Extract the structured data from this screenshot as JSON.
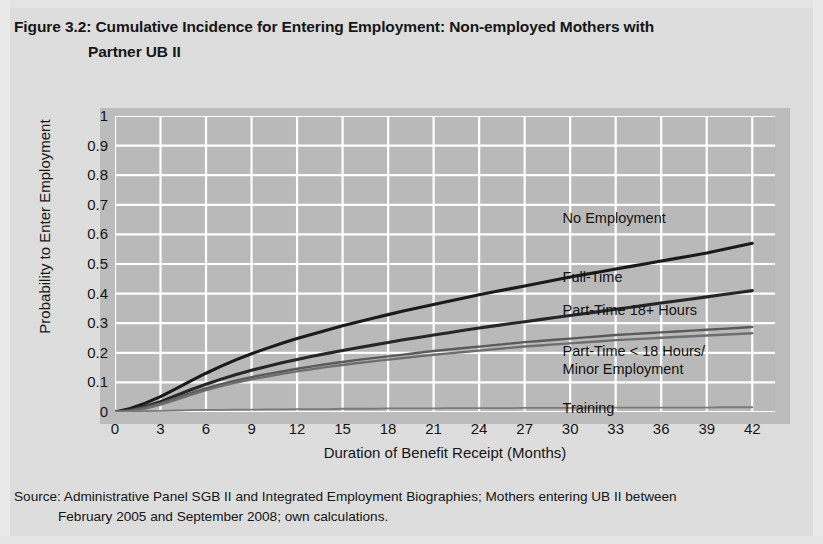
{
  "figure": {
    "title_line1": "Figure 3.2: Cumulative Incidence for Entering Employment: Non-employed Mothers with",
    "title_line2": "Partner UB II",
    "source_line1": "Source: Administrative Panel SGB II and Integrated Employment Biographies; Mothers entering UB II between",
    "source_line2": "February 2005 and September 2008; own calculations."
  },
  "colors": {
    "page_bg": "#dddddd",
    "plot_bg": "#b9b9b9",
    "gridline": "#ffffff",
    "curve_dark": "#1a1a1a",
    "curve_mid": "#3c3c3c",
    "curve_light": "#6e6e6e",
    "curve_training": "#7a7a7a",
    "text": "#161616"
  },
  "chart_data": {
    "type": "line",
    "title": "Figure 3.2: Cumulative Incidence for Entering Employment: Non-employed Mothers with Partner UB II",
    "xlabel": "Duration of Benefit Receipt (Months)",
    "ylabel": "Probability to Enter Employment",
    "xlim": [
      0,
      43.5
    ],
    "ylim": [
      0,
      1
    ],
    "xticks": [
      0,
      3,
      6,
      9,
      12,
      15,
      18,
      21,
      24,
      27,
      30,
      33,
      36,
      39,
      42
    ],
    "yticks": [
      "0",
      "0.1",
      "0.2",
      "0.3",
      "0.4",
      "0.5",
      "0.6",
      "0.7",
      "0.8",
      "0.9",
      "1"
    ],
    "grid": true,
    "legend_position": "in-plot annotations",
    "x": [
      0,
      1,
      2,
      3,
      4,
      5,
      6,
      7,
      8,
      9,
      10,
      11,
      12,
      13,
      14,
      15,
      16,
      17,
      18,
      19,
      20,
      21,
      22,
      23,
      24,
      25,
      26,
      27,
      28,
      29,
      30,
      31,
      32,
      33,
      34,
      35,
      36,
      37,
      38,
      39,
      40,
      41,
      42
    ],
    "series": [
      {
        "name": "No Employment",
        "label": "No Employment",
        "color": "#1a1a1a",
        "label_x": 29.5,
        "label_y": 0.655,
        "values": [
          0.0,
          0.012,
          0.03,
          0.052,
          0.078,
          0.105,
          0.131,
          0.155,
          0.177,
          0.197,
          0.215,
          0.232,
          0.248,
          0.263,
          0.277,
          0.291,
          0.304,
          0.317,
          0.329,
          0.341,
          0.352,
          0.363,
          0.374,
          0.385,
          0.396,
          0.406,
          0.416,
          0.426,
          0.436,
          0.446,
          0.456,
          0.465,
          0.474,
          0.483,
          0.492,
          0.501,
          0.51,
          0.519,
          0.528,
          0.537,
          0.548,
          0.559,
          0.57
        ]
      },
      {
        "name": "Full-Time",
        "label": "Full-Time",
        "color": "#262626",
        "label_x": 29.5,
        "label_y": 0.455,
        "values": [
          0.0,
          0.007,
          0.019,
          0.035,
          0.055,
          0.075,
          0.094,
          0.111,
          0.127,
          0.141,
          0.154,
          0.166,
          0.177,
          0.188,
          0.198,
          0.208,
          0.217,
          0.226,
          0.235,
          0.244,
          0.252,
          0.26,
          0.268,
          0.276,
          0.284,
          0.291,
          0.298,
          0.305,
          0.312,
          0.319,
          0.326,
          0.333,
          0.34,
          0.347,
          0.354,
          0.361,
          0.368,
          0.375,
          0.382,
          0.389,
          0.396,
          0.403,
          0.41
        ]
      },
      {
        "name": "Part-Time 18+ Hours",
        "label": "Part-Time 18+ Hours",
        "color": "#5a5a5a",
        "label_x": 29.5,
        "label_y": 0.345,
        "values": [
          0.0,
          0.006,
          0.016,
          0.03,
          0.047,
          0.064,
          0.08,
          0.094,
          0.107,
          0.118,
          0.128,
          0.137,
          0.146,
          0.154,
          0.162,
          0.169,
          0.176,
          0.182,
          0.188,
          0.194,
          0.2,
          0.206,
          0.211,
          0.216,
          0.221,
          0.226,
          0.231,
          0.236,
          0.24,
          0.244,
          0.248,
          0.252,
          0.256,
          0.26,
          0.263,
          0.266,
          0.269,
          0.272,
          0.275,
          0.278,
          0.281,
          0.284,
          0.287
        ]
      },
      {
        "name": "Part-Time < 18 Hours/Minor Employment",
        "label": "Part-Time < 18 Hours/\nMinor Employment",
        "color": "#6e6e6e",
        "label_x": 29.5,
        "label_y": 0.205,
        "values": null
      },
      {
        "name": "Training",
        "label": "Training",
        "color": "#7a7a7a",
        "label_x": 29.5,
        "label_y": 0.015,
        "values": [
          0.0,
          0.002,
          0.003,
          0.004,
          0.005,
          0.006,
          0.007,
          0.007,
          0.008,
          0.008,
          0.009,
          0.009,
          0.01,
          0.01,
          0.01,
          0.011,
          0.011,
          0.011,
          0.012,
          0.012,
          0.012,
          0.012,
          0.013,
          0.013,
          0.013,
          0.013,
          0.013,
          0.014,
          0.014,
          0.014,
          0.014,
          0.014,
          0.014,
          0.015,
          0.015,
          0.015,
          0.015,
          0.015,
          0.015,
          0.015,
          0.016,
          0.016,
          0.016
        ]
      }
    ]
  }
}
